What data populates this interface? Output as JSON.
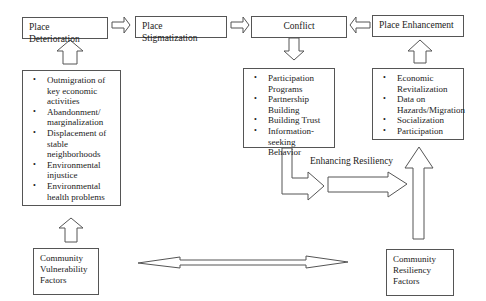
{
  "top_row": {
    "deterioration": "Place Deterioration",
    "stigmatization": "Place Stigmatization",
    "conflict": "Conflict",
    "enhancement": "Place Enhancement"
  },
  "vulnerability_list": [
    "Outmigration of key economic activities",
    "Abandonment/ marginalization",
    "Displacement of stable neighborhoods",
    "Environmental injustice",
    "Environmental health problems"
  ],
  "conflict_list": [
    "Participation Programs",
    "Partnership Building",
    "Building Trust",
    "Information-seeking Behavior"
  ],
  "enhancement_list": [
    "Economic Revitalization",
    "Data on Hazards/Migration",
    "Socialization",
    "Participation"
  ],
  "labels": {
    "enhancing_resiliency": "Enhancing Resiliency"
  },
  "bottom": {
    "vulnerability_factors": [
      "Community",
      "Vulnerability",
      "Factors"
    ],
    "resiliency_factors": [
      "Community",
      "Resiliency",
      "Factors"
    ]
  }
}
